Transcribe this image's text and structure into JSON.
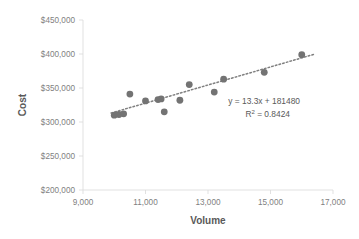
{
  "chart_data": {
    "type": "scatter",
    "title": "",
    "xlabel": "Volume",
    "ylabel": "Cost",
    "xlim": [
      9000,
      17000
    ],
    "ylim": [
      200000,
      450000
    ],
    "xticks": [
      "9,000",
      "11,000",
      "13,000",
      "15,000",
      "17,000"
    ],
    "xtick_values": [
      9000,
      11000,
      13000,
      15000,
      17000
    ],
    "yticks": [
      "$200,000",
      "$250,000",
      "$300,000",
      "$350,000",
      "$400,000",
      "$450,000"
    ],
    "ytick_values": [
      200000,
      250000,
      300000,
      350000,
      400000,
      450000
    ],
    "grid": false,
    "legend": "none",
    "marker_color": "#737373",
    "trendline_color": "#808080",
    "axis_color": "#d9d9d9",
    "label_color": "#7f7f7f",
    "title_color": "#595959",
    "points": [
      {
        "x": 10000,
        "y": 310000
      },
      {
        "x": 10150,
        "y": 311000
      },
      {
        "x": 10300,
        "y": 312000
      },
      {
        "x": 10500,
        "y": 341000
      },
      {
        "x": 11000,
        "y": 331000
      },
      {
        "x": 11400,
        "y": 333000
      },
      {
        "x": 11500,
        "y": 334000
      },
      {
        "x": 11600,
        "y": 315000
      },
      {
        "x": 12100,
        "y": 332000
      },
      {
        "x": 12400,
        "y": 355000
      },
      {
        "x": 13200,
        "y": 344000
      },
      {
        "x": 13500,
        "y": 363000
      },
      {
        "x": 14800,
        "y": 373000
      },
      {
        "x": 16000,
        "y": 399000
      }
    ],
    "trendline": {
      "slope": 13.3,
      "intercept": 181480,
      "x_start": 9900,
      "x_end": 16400
    },
    "annotations": {
      "equation": "y = 13.3x + 181480",
      "r_squared_prefix": "R",
      "r_squared_sup": "2",
      "r_squared_value": " = 0.8424"
    }
  }
}
